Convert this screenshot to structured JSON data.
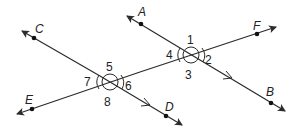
{
  "diagram": {
    "title": "",
    "colors": {
      "line": "#2b2b2b",
      "background": "#ffffff"
    },
    "lines": [
      {
        "name": "EF",
        "from": [
          17,
          114
        ],
        "to": [
          276,
          27
        ],
        "points": [
          "E",
          "F"
        ]
      },
      {
        "name": "CD",
        "from": [
          22,
          31
        ],
        "to": [
          182,
          125
        ],
        "points": [
          "C",
          "D"
        ],
        "parallel_mark": true
      },
      {
        "name": "AB",
        "from": [
          127,
          16
        ],
        "to": [
          285,
          111
        ],
        "points": [
          "A",
          "B"
        ],
        "parallel_mark": true
      }
    ],
    "points": {
      "A": {
        "label": "A",
        "x": 141,
        "y": 24
      },
      "B": {
        "label": "B",
        "x": 271,
        "y": 103
      },
      "C": {
        "label": "C",
        "x": 34,
        "y": 38
      },
      "D": {
        "label": "D",
        "x": 166,
        "y": 116
      },
      "E": {
        "label": "E",
        "x": 32,
        "y": 109
      },
      "F": {
        "label": "F",
        "x": 257,
        "y": 34
      }
    },
    "angles": {
      "a1": "1",
      "a2": "2",
      "a3": "3",
      "a4": "4",
      "a5": "5",
      "a6": "6",
      "a7": "7",
      "a8": "8"
    }
  }
}
